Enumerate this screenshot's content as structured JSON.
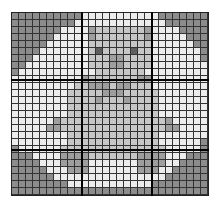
{
  "grid": {
    "cols": 28,
    "rows": 26,
    "cell_size": 7,
    "major_every": 10,
    "palette": {
      "D": "#8c8c8c",
      "L": "#ececec",
      "M": "#c6c6c6",
      "B": "#9e9e9e",
      "E": "#5e5e5e"
    },
    "pattern": [
      "DDDDDDDDDDLLLLLLLLLLLDDDDDDD",
      "DDDDDDDDDLLLLLLLLLLLLLDDDDDD",
      "DDDDDDDLLLLBMMMMMMMBLLLLDDDD",
      "DDDDDDLLLLLBMMMMMMMBLLLLLDDD",
      "DDDDDLLLLLLMMMMMMMMMLLLLLLDD",
      "DDDDLLLLLLLMEMMMMEMMLLLLLLLD",
      "DDDLLLLLLLLMMMBBMMMMLLLLLLLD",
      "DDLLLLLLLLLMMMBBMMMMLLLLLLLL",
      "DLLLLLLLLLLLMMMMMMMLLLLLLLLL",
      "LLLLLLLLLLBMMMMMMMBBLLLLLLLL",
      "LLLLLLLLLMMBBBMBBMMMLLLLLLLL",
      "LLLLLLLLMMMMMBBBMMMMMLLLLLLL",
      "LLLLLLLLMMMMBMMMBMMMMLLLLLLL",
      "LLLLLLLLMMMMMMMMMMMMMLLLLLLL",
      "LLLLLLLLMMMMMMMMMMMMMLLLLLLL",
      "LLLLLLBMMMMMMMMMMMMMMMBLLLLL",
      "LLLLLBBMMMMMMMMMMMMMMMBBLLLL",
      "LLLLLLLLMMMMMMMMMMMMMLLLLLLL",
      "LLLLLLLLMMMMMMMMMMMMMLLLLLLD",
      "DLLLLLLMMMMMMMMMMMMMMMLLLLLD",
      "DDDLLLLBBBBMMMMMMMBBBBLLLDDD",
      "DDDDLLLBBBBLLLLLLLBBBBLLDDDD",
      "DDDDDLLLBBBLLLLLLLBBBLLDDDDD",
      "DDDDDDLLLLLLLLLLLLLLLLDDDDDD",
      "DDDDDDDDLLLLLLLLLLLLDDDDDDDD",
      "DDDDDDDDDDDDDDDDDDDDDDDDDDDD"
    ]
  }
}
